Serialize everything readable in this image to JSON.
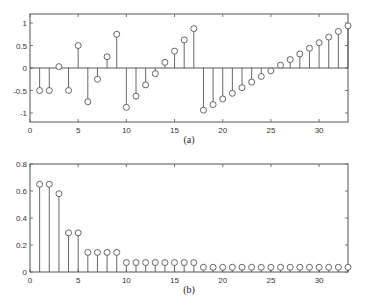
{
  "chart_data": [
    {
      "type": "stem",
      "title": "",
      "caption": "(a)",
      "xlabel": "",
      "ylabel": "",
      "xlim": [
        0,
        33
      ],
      "ylim": [
        -1.2,
        1.2
      ],
      "xticks": [
        0,
        5,
        10,
        15,
        20,
        25,
        30
      ],
      "yticks": [
        -1,
        -0.5,
        0,
        0.5,
        1
      ],
      "ytick_labels": [
        "-1",
        "-0.5",
        "0",
        "0.5",
        "1"
      ],
      "grid": false,
      "x": [
        1,
        2,
        3,
        4,
        5,
        6,
        7,
        8,
        9,
        10,
        11,
        12,
        13,
        14,
        15,
        16,
        17,
        18,
        19,
        20,
        21,
        22,
        23,
        24,
        25,
        26,
        27,
        28,
        29,
        30,
        31,
        32,
        33
      ],
      "values": [
        -0.5,
        -0.5,
        0.03,
        -0.5,
        0.5,
        -0.75,
        -0.25,
        0.25,
        0.75,
        -0.875,
        -0.625,
        -0.375,
        -0.125,
        0.125,
        0.375,
        0.625,
        0.875,
        -0.9375,
        -0.8125,
        -0.6875,
        -0.5625,
        -0.4375,
        -0.3125,
        -0.1875,
        -0.0625,
        0.0625,
        0.1875,
        0.3125,
        0.4375,
        0.5625,
        0.6875,
        0.8125,
        0.9375
      ]
    },
    {
      "type": "stem",
      "title": "",
      "caption": "(b)",
      "xlabel": "",
      "ylabel": "",
      "xlim": [
        0,
        33
      ],
      "ylim": [
        0,
        0.8
      ],
      "xticks": [
        0,
        5,
        10,
        15,
        20,
        25,
        30
      ],
      "yticks": [
        0,
        0.2,
        0.4,
        0.6,
        0.8
      ],
      "ytick_labels": [
        "0",
        "0.2",
        "0.4",
        "0.6",
        "0.8"
      ],
      "grid": false,
      "x": [
        1,
        2,
        3,
        4,
        5,
        6,
        7,
        8,
        9,
        10,
        11,
        12,
        13,
        14,
        15,
        16,
        17,
        18,
        19,
        20,
        21,
        22,
        23,
        24,
        25,
        26,
        27,
        28,
        29,
        30,
        31,
        32,
        33
      ],
      "values": [
        0.65,
        0.65,
        0.58,
        0.29,
        0.29,
        0.145,
        0.145,
        0.145,
        0.145,
        0.07,
        0.07,
        0.07,
        0.07,
        0.07,
        0.07,
        0.07,
        0.07,
        0.035,
        0.035,
        0.035,
        0.035,
        0.035,
        0.035,
        0.035,
        0.035,
        0.035,
        0.035,
        0.035,
        0.035,
        0.035,
        0.035,
        0.035,
        0.035
      ]
    }
  ],
  "layout": {
    "plots": [
      {
        "left": 30,
        "right": 348,
        "top": 14,
        "bottom": 122,
        "caption_y": 143
      },
      {
        "left": 30,
        "right": 348,
        "top": 164,
        "bottom": 272,
        "caption_y": 293
      }
    ]
  }
}
